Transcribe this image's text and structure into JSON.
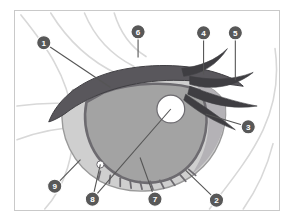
{
  "figure": {
    "background_color": "#ffffff",
    "frame_color": "#c9c9c9",
    "label_circle_color": "#585858",
    "label_text_color": "#ffffff",
    "leader_line_color": "#555555"
  },
  "palette": {
    "upper_lid_dark": "#59575c",
    "lash_dark": "#3f3e42",
    "iris_mid": "#a3a3a3",
    "iris_outline": "#6d6b70",
    "sclera_light": "#cfcfcf",
    "sclera_outline": "#9a9a9a",
    "inner_corner_shade": "#b4b2b6",
    "highlight_white": "#ffffff",
    "hair_strand": "#d8d8d8"
  },
  "callouts": [
    {
      "id": "1",
      "label": "1",
      "cx": 29,
      "cy": 32,
      "lx": 96,
      "ly": 77
    },
    {
      "id": "2",
      "label": "2",
      "cx": 203,
      "cy": 191,
      "lx": 172,
      "ly": 161
    },
    {
      "id": "3",
      "label": "3",
      "cx": 235,
      "cy": 117,
      "lx": 192,
      "ly": 104
    },
    {
      "id": "4",
      "label": "4",
      "cx": 190,
      "cy": 22,
      "lx": 190,
      "ly": 64
    },
    {
      "id": "5",
      "label": "5",
      "cx": 222,
      "cy": 22,
      "lx": 222,
      "ly": 70
    },
    {
      "id": "6",
      "label": "6",
      "cx": 124,
      "cy": 21,
      "lx": 124,
      "ly": 47
    },
    {
      "id": "7",
      "label": "7",
      "cx": 141,
      "cy": 190,
      "lx": 126,
      "ly": 148
    },
    {
      "id": "8",
      "label": "8",
      "cx": 78,
      "cy": 190,
      "lx": 86,
      "ly": 155
    },
    {
      "id": "8b",
      "label": "8",
      "cx": 78,
      "cy": 190,
      "lx": 157,
      "ly": 99
    },
    {
      "id": "9",
      "label": "9",
      "cx": 40,
      "cy": 177,
      "lx": 66,
      "ly": 150
    }
  ],
  "hair_strands": [
    "M 6 4 C 26 30, 52 60, 58 106 C 62 142, 50 178, 30 200",
    "M 36 2 C 52 28, 74 50, 104 64",
    "M 70 2 C 80 26, 96 44, 120 56",
    "M 100 2 C 106 22, 116 36, 132 46",
    "M 2 96 C 30 92, 60 92, 86 98",
    "M 2 130 C 24 122, 44 118, 62 118",
    "M 196 200 C 214 176, 236 150, 250 120 C 262 94, 266 66, 262 38",
    "M 230 200 C 244 180, 254 158, 260 134"
  ],
  "lower_lashes": [
    {
      "x1": 86,
      "y1": 162,
      "x2": 84,
      "y2": 170
    },
    {
      "x1": 96,
      "y1": 166,
      "x2": 95,
      "y2": 174
    },
    {
      "x1": 106,
      "y1": 169,
      "x2": 106,
      "y2": 177
    },
    {
      "x1": 116,
      "y1": 171,
      "x2": 117,
      "y2": 179
    },
    {
      "x1": 126,
      "y1": 172,
      "x2": 128,
      "y2": 180
    },
    {
      "x1": 136,
      "y1": 172,
      "x2": 139,
      "y2": 180
    },
    {
      "x1": 146,
      "y1": 171,
      "x2": 150,
      "y2": 179
    },
    {
      "x1": 156,
      "y1": 169,
      "x2": 161,
      "y2": 176
    },
    {
      "x1": 166,
      "y1": 165,
      "x2": 172,
      "y2": 172
    },
    {
      "x1": 175,
      "y1": 160,
      "x2": 182,
      "y2": 166
    }
  ],
  "eyelashes_right": [
    {
      "d": "M 168 58 C 186 56, 202 50, 214 38 C 204 54, 188 64, 170 66 Z"
    },
    {
      "d": "M 176 66 C 198 70, 220 70, 240 62 C 220 78, 196 80, 176 74 Z"
    },
    {
      "d": "M 176 76 C 198 84, 222 92, 244 96 C 220 100, 194 94, 174 84 Z"
    },
    {
      "d": "M 172 84 C 190 96, 208 108, 222 120 C 200 112, 182 100, 170 90 Z"
    }
  ]
}
